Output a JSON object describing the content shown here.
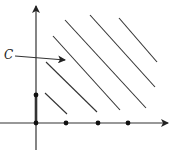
{
  "diagram": {
    "label_c": "C",
    "axes": {
      "origin": [
        36,
        123
      ],
      "x_axis": {
        "from": [
          0,
          123
        ],
        "to": [
          168,
          123
        ]
      },
      "y_axis": {
        "from": [
          36,
          150
        ],
        "to": [
          36,
          6
        ]
      }
    },
    "points": [
      {
        "x": 36,
        "y": 123
      },
      {
        "x": 66,
        "y": 123
      },
      {
        "x": 98,
        "y": 123
      },
      {
        "x": 128,
        "y": 123
      },
      {
        "x": 36,
        "y": 95
      }
    ],
    "thick_segment": {
      "from": [
        36,
        95
      ],
      "to": [
        36,
        123
      ]
    },
    "lines": [
      {
        "from": [
          45,
          93
        ],
        "to": [
          67,
          114
        ]
      },
      {
        "from": [
          46,
          62
        ],
        "to": [
          97,
          112
        ]
      },
      {
        "from": [
          53,
          36
        ],
        "to": [
          120,
          110
        ]
      },
      {
        "from": [
          65,
          20
        ],
        "to": [
          146,
          108
        ]
      },
      {
        "from": [
          90,
          15
        ],
        "to": [
          155,
          87
        ]
      },
      {
        "from": [
          119,
          18
        ],
        "to": [
          157,
          62
        ]
      }
    ],
    "pointer_arrow": {
      "from": [
        15,
        56
      ],
      "to": [
        65,
        60
      ]
    },
    "colors": {
      "stroke": "#333333",
      "background": "#ffffff"
    }
  }
}
